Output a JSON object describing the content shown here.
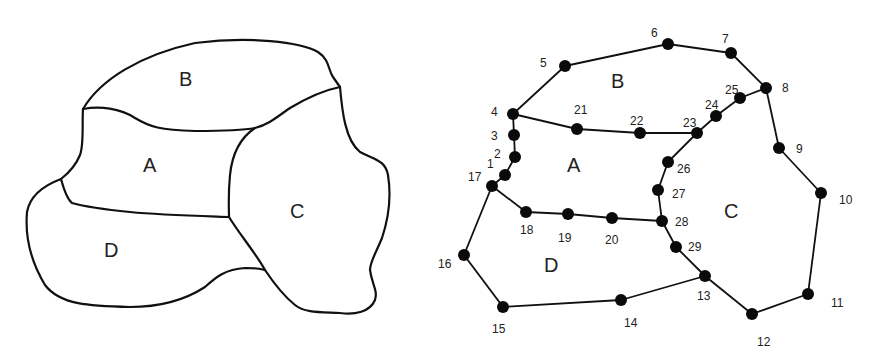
{
  "left_map": {
    "regions": [
      {
        "id": "B",
        "label": "B",
        "x": 187,
        "y": 86
      },
      {
        "id": "A",
        "label": "A",
        "x": 150,
        "y": 172
      },
      {
        "id": "C",
        "label": "C",
        "x": 297,
        "y": 218
      },
      {
        "id": "D",
        "label": "D",
        "x": 111,
        "y": 257
      }
    ]
  },
  "right_graph": {
    "regions": [
      {
        "id": "B",
        "label": "B",
        "x": 619,
        "y": 88
      },
      {
        "id": "A",
        "label": "A",
        "x": 574,
        "y": 172
      },
      {
        "id": "C",
        "label": "C",
        "x": 731,
        "y": 218
      },
      {
        "id": "D",
        "label": "D",
        "x": 551,
        "y": 272
      }
    ],
    "nodes": [
      {
        "id": 1,
        "label": "1",
        "x": 505,
        "y": 175,
        "lx": 487,
        "ly": 168
      },
      {
        "id": 2,
        "label": "2",
        "x": 515,
        "y": 157,
        "lx": 494,
        "ly": 158
      },
      {
        "id": 3,
        "label": "3",
        "x": 514,
        "y": 135,
        "lx": 491,
        "ly": 140
      },
      {
        "id": 4,
        "label": "4",
        "x": 513,
        "y": 114,
        "lx": 491,
        "ly": 116
      },
      {
        "id": 5,
        "label": "5",
        "x": 565,
        "y": 66,
        "lx": 540,
        "ly": 67
      },
      {
        "id": 6,
        "label": "6",
        "x": 668,
        "y": 44,
        "lx": 651,
        "ly": 37
      },
      {
        "id": 7,
        "label": "7",
        "x": 731,
        "y": 53,
        "lx": 722,
        "ly": 43
      },
      {
        "id": 8,
        "label": "8",
        "x": 766,
        "y": 88,
        "lx": 782,
        "ly": 92
      },
      {
        "id": 9,
        "label": "9",
        "x": 779,
        "y": 148,
        "lx": 796,
        "ly": 153
      },
      {
        "id": 10,
        "label": "10",
        "x": 821,
        "y": 193,
        "lx": 839,
        "ly": 204
      },
      {
        "id": 11,
        "label": "11",
        "x": 808,
        "y": 294,
        "lx": 831,
        "ly": 307
      },
      {
        "id": 12,
        "label": "12",
        "x": 752,
        "y": 314,
        "lx": 757,
        "ly": 346
      },
      {
        "id": 13,
        "label": "13",
        "x": 705,
        "y": 276,
        "lx": 697,
        "ly": 300
      },
      {
        "id": 14,
        "label": "14",
        "x": 621,
        "y": 300,
        "lx": 624,
        "ly": 327
      },
      {
        "id": 15,
        "label": "15",
        "x": 503,
        "y": 307,
        "lx": 492,
        "ly": 333
      },
      {
        "id": 16,
        "label": "16",
        "x": 464,
        "y": 255,
        "lx": 438,
        "ly": 268
      },
      {
        "id": 17,
        "label": "17",
        "x": 492,
        "y": 186,
        "lx": 468,
        "ly": 181
      },
      {
        "id": 18,
        "label": "18",
        "x": 526,
        "y": 212,
        "lx": 520,
        "ly": 234
      },
      {
        "id": 19,
        "label": "19",
        "x": 568,
        "y": 214,
        "lx": 558,
        "ly": 242
      },
      {
        "id": 20,
        "label": "20",
        "x": 612,
        "y": 218,
        "lx": 605,
        "ly": 244
      },
      {
        "id": 21,
        "label": "21",
        "x": 577,
        "y": 129,
        "lx": 574,
        "ly": 114
      },
      {
        "id": 22,
        "label": "22",
        "x": 640,
        "y": 133,
        "lx": 630,
        "ly": 125
      },
      {
        "id": 23,
        "label": "23",
        "x": 697,
        "y": 133,
        "lx": 683,
        "ly": 127
      },
      {
        "id": 24,
        "label": "24",
        "x": 716,
        "y": 116,
        "lx": 705,
        "ly": 109
      },
      {
        "id": 25,
        "label": "25",
        "x": 740,
        "y": 98,
        "lx": 725,
        "ly": 94
      },
      {
        "id": 26,
        "label": "26",
        "x": 668,
        "y": 162,
        "lx": 677,
        "ly": 173
      },
      {
        "id": 27,
        "label": "27",
        "x": 658,
        "y": 190,
        "lx": 672,
        "ly": 198
      },
      {
        "id": 28,
        "label": "28",
        "x": 662,
        "y": 221,
        "lx": 675,
        "ly": 226
      },
      {
        "id": 29,
        "label": "29",
        "x": 676,
        "y": 247,
        "lx": 688,
        "ly": 251
      }
    ],
    "edges": [
      [
        17,
        1
      ],
      [
        1,
        2
      ],
      [
        2,
        3
      ],
      [
        3,
        4
      ],
      [
        4,
        5
      ],
      [
        5,
        6
      ],
      [
        6,
        7
      ],
      [
        7,
        8
      ],
      [
        8,
        9
      ],
      [
        9,
        10
      ],
      [
        10,
        11
      ],
      [
        11,
        12
      ],
      [
        12,
        13
      ],
      [
        13,
        14
      ],
      [
        14,
        15
      ],
      [
        15,
        16
      ],
      [
        16,
        17
      ],
      [
        4,
        21
      ],
      [
        21,
        22
      ],
      [
        22,
        23
      ],
      [
        23,
        24
      ],
      [
        24,
        25
      ],
      [
        25,
        8
      ],
      [
        23,
        26
      ],
      [
        26,
        27
      ],
      [
        27,
        28
      ],
      [
        28,
        29
      ],
      [
        29,
        13
      ],
      [
        17,
        18
      ],
      [
        18,
        19
      ],
      [
        19,
        20
      ],
      [
        20,
        28
      ]
    ]
  }
}
